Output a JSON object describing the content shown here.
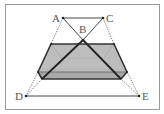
{
  "diagram": {
    "colors": {
      "frame": "#9a9a9a",
      "line": "#333333",
      "thick": "#222222",
      "fill": "#b8b8b8",
      "fill_light": "#cfcfcf",
      "dotted": "#555555",
      "label": "#555555"
    },
    "points": [
      {
        "id": "A",
        "label": "A",
        "x": 63,
        "y": 18
      },
      {
        "id": "B",
        "label": "B",
        "x": 83,
        "y": 40
      },
      {
        "id": "C",
        "label": "C",
        "x": 103,
        "y": 18
      },
      {
        "id": "D",
        "label": "D",
        "x": 26,
        "y": 96
      },
      {
        "id": "E",
        "label": "E",
        "x": 139,
        "y": 96
      }
    ]
  }
}
